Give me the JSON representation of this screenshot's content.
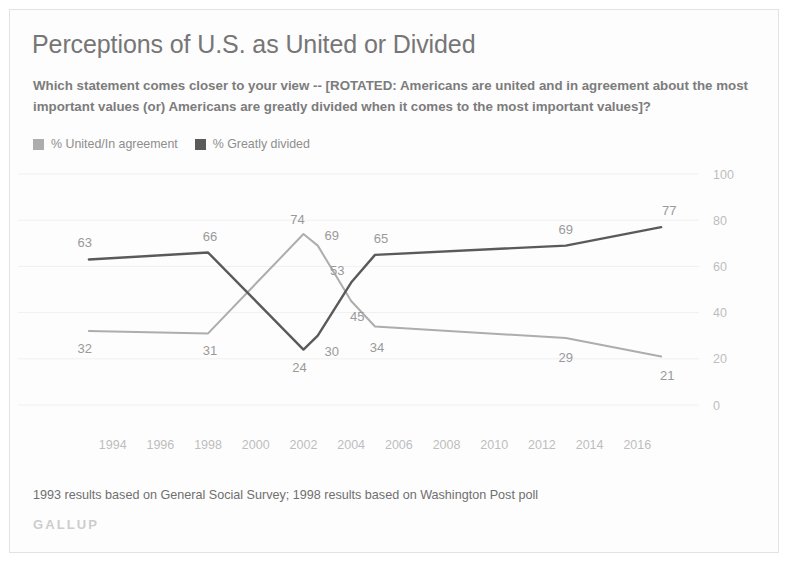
{
  "title": "Perceptions of U.S. as United or Divided",
  "subtitle": "Which statement comes closer to your view -- [ROTATED: Americans are united and in agreement about the most important values (or) Americans are greatly divided when it comes to the most important values]?",
  "footnote": "1993 results based on General Social Survey; 1998 results based on Washington Post poll",
  "brand": "GALLUP",
  "colors": {
    "united": "#adadad",
    "divided": "#5a5a5a",
    "label": "#9a9a9a",
    "tick": "#bdbdbd",
    "grid": "#f0f0f0"
  },
  "chart_data": {
    "type": "line",
    "title": "Perceptions of U.S. as United or Divided",
    "xlabel": "",
    "ylabel": "",
    "ylim": [
      0,
      100
    ],
    "xlim": [
      1992,
      2018
    ],
    "yticks": [
      0,
      20,
      40,
      60,
      80,
      100
    ],
    "xticks": [
      1994,
      1996,
      1998,
      2000,
      2002,
      2004,
      2006,
      2008,
      2010,
      2012,
      2014,
      2016
    ],
    "grid": true,
    "legend_position": "top-left",
    "series": [
      {
        "name": "% United/In agreement",
        "color": "#adadad",
        "x": [
          1993,
          1998,
          2002,
          2002.6,
          2004,
          2005,
          2013,
          2017
        ],
        "values": [
          32,
          31,
          74,
          69,
          45,
          34,
          29,
          21
        ],
        "labels": [
          "32",
          "31",
          "74",
          "69",
          "45",
          "34",
          "29",
          "21"
        ]
      },
      {
        "name": "% Greatly divided",
        "color": "#5a5a5a",
        "x": [
          1993,
          1998,
          2002,
          2002.6,
          2004,
          2005,
          2013,
          2017
        ],
        "values": [
          63,
          66,
          24,
          30,
          53,
          65,
          69,
          77
        ],
        "labels": [
          "63",
          "66",
          "24",
          "30",
          "53",
          "65",
          "69",
          "77"
        ]
      }
    ]
  },
  "legend": [
    {
      "label": "% United/In agreement",
      "color": "#adadad"
    },
    {
      "label": "% Greatly divided",
      "color": "#5a5a5a"
    }
  ]
}
